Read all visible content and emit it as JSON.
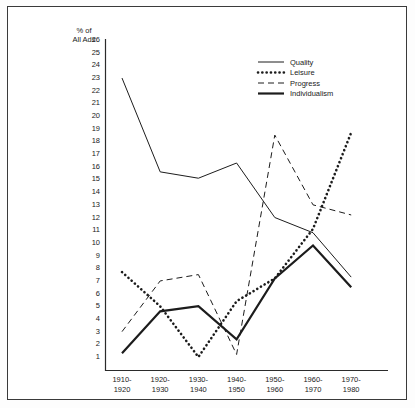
{
  "chart_data": {
    "type": "line",
    "title": "",
    "ylabel": "% of\nAll Ads",
    "xlabel": "",
    "categories": [
      "1910-\n1920",
      "1920-\n1930",
      "1930-\n1940",
      "1940-\n1950",
      "1950-\n1960",
      "1960-\n1970",
      "1970-\n1980"
    ],
    "ylim": [
      0,
      26
    ],
    "yticks": [
      1,
      2,
      3,
      4,
      5,
      6,
      7,
      8,
      9,
      10,
      11,
      12,
      13,
      14,
      15,
      16,
      17,
      18,
      19,
      20,
      21,
      22,
      23,
      24,
      25,
      26
    ],
    "grid": false,
    "legend_position": "top-right",
    "series": [
      {
        "name": "Quality",
        "style": "solid-thin",
        "values": [
          23.0,
          15.6,
          15.1,
          16.3,
          12.0,
          10.8,
          7.3
        ]
      },
      {
        "name": "Leisure",
        "style": "dotted",
        "values": [
          7.7,
          5.0,
          1.0,
          5.4,
          7.2,
          11.1,
          18.7
        ]
      },
      {
        "name": "Progress",
        "style": "dashed",
        "values": [
          3.0,
          7.0,
          7.5,
          1.2,
          18.5,
          13.0,
          12.2
        ]
      },
      {
        "name": "Individualism",
        "style": "solid-thick",
        "values": [
          1.3,
          4.6,
          5.0,
          2.4,
          7.2,
          9.8,
          6.5
        ]
      }
    ]
  },
  "axis": {
    "y_title_line1": "% of",
    "y_title_line2": "All Ads"
  },
  "legend": {
    "items": [
      {
        "label": "Quality",
        "style": "solid-thin"
      },
      {
        "label": "Leisure",
        "style": "dotted"
      },
      {
        "label": "Progress",
        "style": "dashed"
      },
      {
        "label": "Individualism",
        "style": "solid-thick"
      }
    ]
  }
}
